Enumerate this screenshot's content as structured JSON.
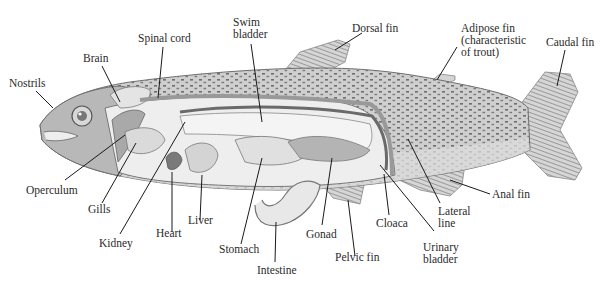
{
  "diagram": {
    "colors": {
      "background": "#ffffff",
      "label_text": "#2a2a2a",
      "leader_line": "#1a1a1a",
      "body_skin": "#c9c9c9",
      "spots": "#6a6a6a",
      "organs": "#e6e6e6"
    },
    "labels": {
      "nostrils": "Nostrils",
      "brain": "Brain",
      "spinal_cord": "Spinal cord",
      "swim_bladder": "Swim\nbladder",
      "dorsal_fin": "Dorsal fin",
      "adipose_fin": "Adipose fin\n(characteristic\nof trout)",
      "caudal_fin": "Caudal fin",
      "operculum": "Operculum",
      "gills": "Gills",
      "kidney": "Kidney",
      "heart": "Heart",
      "liver": "Liver",
      "stomach": "Stomach",
      "intestine": "Intestine",
      "gonad": "Gonad",
      "pelvic_fin": "Pelvic fin",
      "cloaca": "Cloaca",
      "urinary_bladder": "Urinary\nbladder",
      "lateral_line": "Lateral\nline",
      "anal_fin": "Anal fin"
    }
  }
}
